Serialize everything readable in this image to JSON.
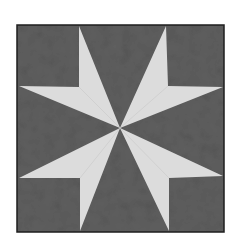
{
  "image": {
    "subject": "quilt block with eight-pointed star",
    "colors": {
      "background": "#ffffff",
      "dark_fabric": "#5f5f5f",
      "light_fabric": "#dcdcdc",
      "border": "#1e1e1e"
    },
    "block": {
      "x": 17,
      "y": 25,
      "width": 207,
      "height": 207
    },
    "center": [
      120,
      128
    ],
    "star_points": [
      {
        "name": "upper-left",
        "tip_a": [
          79,
          26
        ],
        "corner": [
          79,
          87
        ],
        "tip_b": [
          19,
          86
        ]
      },
      {
        "name": "upper-right",
        "tip_a": [
          166,
          26
        ],
        "corner": [
          168,
          86
        ],
        "tip_b": [
          223,
          87
        ]
      },
      {
        "name": "lower-right",
        "tip_a": [
          223,
          176
        ],
        "corner": [
          169,
          178
        ],
        "tip_b": [
          169,
          231
        ]
      },
      {
        "name": "lower-left",
        "tip_a": [
          80,
          231
        ],
        "corner": [
          80,
          178
        ],
        "tip_b": [
          19,
          178
        ]
      }
    ]
  }
}
